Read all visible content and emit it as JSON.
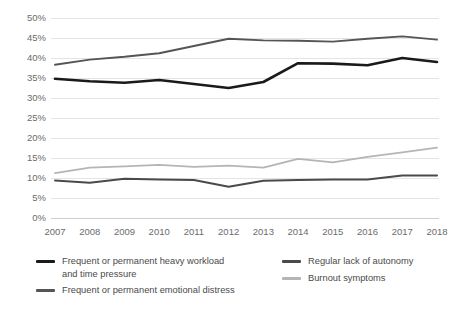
{
  "chart_data": {
    "type": "line",
    "title": "",
    "subtitle": "",
    "xlabel": "",
    "ylabel": "",
    "categories": [
      "2007",
      "2008",
      "2009",
      "2010",
      "2011",
      "2012",
      "2013",
      "2014",
      "2015",
      "2016",
      "2017",
      "2018"
    ],
    "ylim": [
      0,
      50
    ],
    "ytick_values": [
      0,
      5,
      10,
      15,
      20,
      25,
      30,
      35,
      40,
      45,
      50
    ],
    "ytick_labels": [
      "0%",
      "5%",
      "10%",
      "15%",
      "20%",
      "25%",
      "30%",
      "35%",
      "40%",
      "45%",
      "50%"
    ],
    "grid": true,
    "legend_position": "bottom",
    "series": [
      {
        "name": "Frequent or permanent heavy workload and time pressure",
        "color": "#1a1a1a",
        "width": 2.6,
        "values": [
          34.8,
          34.2,
          33.8,
          34.5,
          33.5,
          32.5,
          34.0,
          38.7,
          38.6,
          38.2,
          40.0,
          39.0
        ]
      },
      {
        "name": "Frequent or permanent emotional distress",
        "color": "#555555",
        "width": 1.9,
        "values": [
          38.3,
          39.6,
          40.3,
          41.2,
          43.0,
          44.8,
          44.4,
          44.3,
          44.1,
          44.8,
          45.4,
          44.6
        ]
      },
      {
        "name": "Regular lack of autonomy",
        "color": "#4a4a4a",
        "width": 2.0,
        "values": [
          9.4,
          8.8,
          9.8,
          9.6,
          9.5,
          7.8,
          9.3,
          9.5,
          9.6,
          9.6,
          10.6,
          10.6
        ]
      },
      {
        "name": "Burnout symptoms",
        "color": "#b5b5b5",
        "width": 1.8,
        "values": [
          11.2,
          12.6,
          12.9,
          13.3,
          12.8,
          13.1,
          12.6,
          14.8,
          13.9,
          15.3,
          16.4,
          17.6
        ]
      }
    ]
  },
  "legend": {
    "columns": [
      {
        "items": [
          {
            "label": "Frequent or permanent heavy workload\nand time pressure",
            "color": "#1a1a1a",
            "thickness": 3
          },
          {
            "label": "Frequent or permanent emotional distress",
            "color": "#555555",
            "thickness": 3
          }
        ]
      },
      {
        "items": [
          {
            "label": "Regular lack of autonomy",
            "color": "#4a4a4a",
            "thickness": 3
          },
          {
            "label": "Burnout symptoms",
            "color": "#b5b5b5",
            "thickness": 3
          }
        ]
      }
    ]
  },
  "colors": {
    "background": "#ffffff",
    "grid": "#e4e4e4",
    "axis": "#cfcfcf",
    "tick_text": "#6b6b6b",
    "legend_text": "#4a4a4a"
  }
}
